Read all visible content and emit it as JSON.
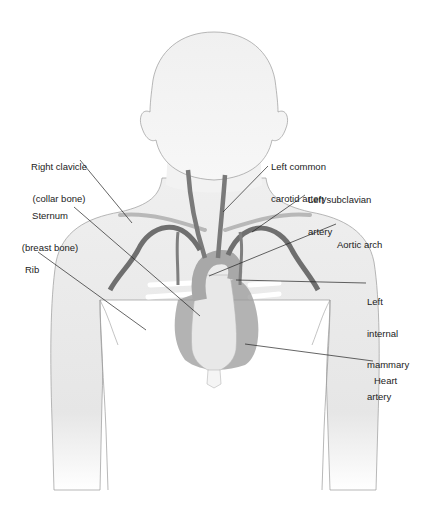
{
  "figure": {
    "colors": {
      "body_fill": "#ececec",
      "outline": "#8a8a8a",
      "artery": "#6f6f6f",
      "heart": "#8c8c8c",
      "rib": "#f8f8f8",
      "leader": "#222222"
    }
  },
  "labels": {
    "right_clavicle": {
      "line1": "Right clavicle",
      "line2": "(collar bone)"
    },
    "sternum": {
      "line1": "Sternum",
      "line2": "(breast bone)"
    },
    "rib": {
      "line1": "Rib"
    },
    "left_common_carotid": {
      "line1": "Left common",
      "line2": "carotid artery"
    },
    "left_subclavian": {
      "line1": "Left subclavian",
      "line2": "artery"
    },
    "aortic_arch": {
      "line1": "Aortic arch"
    },
    "left_internal_mammary": {
      "line1": "Left",
      "line2": "internal",
      "line3": "mammary",
      "line4": "artery"
    },
    "heart": {
      "line1": "Heart"
    }
  }
}
